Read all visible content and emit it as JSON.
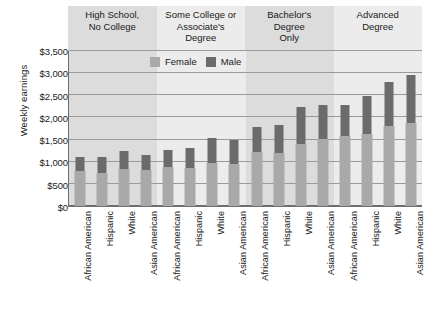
{
  "chart_data": {
    "type": "bar",
    "title": "",
    "subtitle": "",
    "xlabel": "",
    "ylabel": "Weekly earnings",
    "ylim": [
      0,
      3500
    ],
    "ytick_labels": [
      "$3,500",
      "$3,000",
      "$2,500",
      "$2,000",
      "$1,500",
      "$1,000",
      "$500",
      "$0"
    ],
    "ytick_values": [
      3500,
      3000,
      2500,
      2000,
      1500,
      1000,
      500,
      0
    ],
    "grid": true,
    "legend_position": "top-center-inside",
    "legend": [
      "Female",
      "Male"
    ],
    "group_labels": [
      "High School,\nNo College",
      "Some College or\nAssociate's\nDegree",
      "Bachelor's\nDegree\nOnly",
      "Advanced\nDegree"
    ],
    "categories": [
      "African American",
      "Hispanic",
      "White",
      "Asian American"
    ],
    "groups": [
      {
        "name": "High School, No College",
        "categories": [
          "African American",
          "Hispanic",
          "White",
          "Asian American"
        ],
        "series": [
          {
            "name": "Female",
            "values": [
              790,
              740,
              830,
              810
            ]
          },
          {
            "name": "Male",
            "values": [
              1100,
              1100,
              1250,
              1150
            ]
          }
        ]
      },
      {
        "name": "Some College or Associate's Degree",
        "categories": [
          "African American",
          "Hispanic",
          "White",
          "Asian American"
        ],
        "series": [
          {
            "name": "Female",
            "values": [
              870,
              850,
              980,
              960
            ]
          },
          {
            "name": "Male",
            "values": [
              1270,
              1300,
              1540,
              1480
            ]
          }
        ]
      },
      {
        "name": "Bachelor's Degree Only",
        "categories": [
          "African American",
          "Hispanic",
          "White",
          "Asian American"
        ],
        "series": [
          {
            "name": "Female",
            "values": [
              1230,
              1200,
              1390,
              1520
            ]
          },
          {
            "name": "Male",
            "values": [
              1790,
              1830,
              2240,
              2290
            ]
          }
        ]
      },
      {
        "name": "Advanced Degree",
        "categories": [
          "African American",
          "Hispanic",
          "White",
          "Asian American"
        ],
        "series": [
          {
            "name": "Female",
            "values": [
              1570,
              1620,
              1800,
              1870
            ]
          },
          {
            "name": "Male",
            "values": [
              2270,
              2480,
              2800,
              2950
            ]
          }
        ]
      }
    ],
    "colors": {
      "female": "#a9a9a9",
      "male": "#6b6b6b",
      "band_dark": "#dcdcdc",
      "band_light": "#ececec",
      "gridline": "#9a9a9a",
      "axis": "#6e6e6e",
      "background": "#ffffff"
    }
  }
}
